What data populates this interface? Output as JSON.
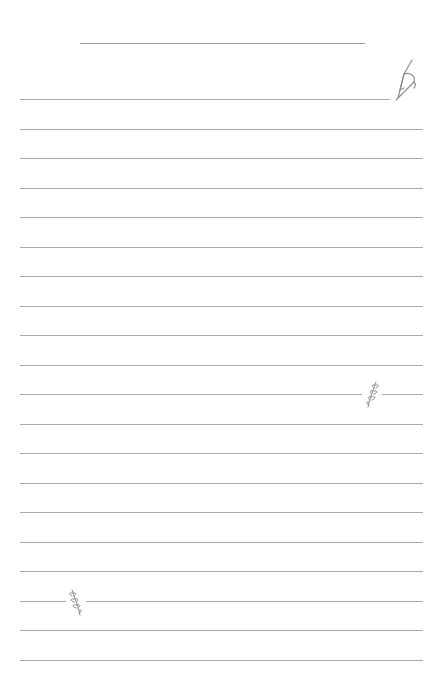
{
  "page": {
    "type": "lined-notepaper",
    "background": "#ffffff",
    "line_color": "#a8a8a8",
    "title_line": {
      "x1": 80,
      "x2": 365,
      "y": 43
    },
    "rules": {
      "x1": 20,
      "x2": 423,
      "first_y": 99,
      "spacing": 29.5,
      "count": 20
    },
    "decorations": [
      {
        "name": "fountain-pen-icon",
        "x": 392,
        "y": 60
      },
      {
        "name": "leaf-sprig-icon",
        "x": 362,
        "y": 380
      },
      {
        "name": "leaf-sprig-icon",
        "x": 66,
        "y": 588
      }
    ]
  }
}
